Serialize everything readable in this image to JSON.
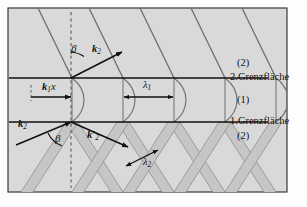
{
  "figure": {
    "type": "physics-wave-diagram",
    "panel": {
      "background_color": "#d9d9d9",
      "border_color": "#3a3a3a",
      "beam_fill_color": "#c2c2c2",
      "beam_stroke_color": "#8c8c8c",
      "line_color": "#2b2b2b"
    }
  },
  "interfaces": [
    {
      "id": "upper",
      "label": "2.Grenzfläche",
      "y": 78
    },
    {
      "id": "lower",
      "label": "1.Grenzfläche",
      "y": 122
    }
  ],
  "regions": [
    {
      "id": "above",
      "label": "(2)",
      "y": 64
    },
    {
      "id": "middle",
      "label": "(1)",
      "y": 100
    },
    {
      "id": "below",
      "label": "(2)",
      "y": 136
    }
  ],
  "vectors": [
    {
      "name": "k2-upper",
      "label_k": "k",
      "sub": "2",
      "prime": false,
      "x": 92,
      "y": 52
    },
    {
      "name": "k1x",
      "label_k": "k",
      "sub": "1",
      "suffix": "x",
      "prime": false,
      "x": 44,
      "y": 89
    },
    {
      "name": "k2-lower",
      "label_k": "k",
      "sub": "2",
      "prime": false,
      "x": 22,
      "y": 126
    },
    {
      "name": "k2-prime",
      "label_k": "k",
      "sub": "2",
      "prime": true,
      "x": 89,
      "y": 137
    }
  ],
  "angles": [
    {
      "name": "beta-upper",
      "label": "β",
      "x": 73,
      "y": 49
    },
    {
      "name": "beta-lower",
      "label": "β",
      "x": 57,
      "y": 139
    }
  ],
  "wavelengths": [
    {
      "name": "lambda-1",
      "label_sym": "λ",
      "sub": "1",
      "x": 148,
      "y": 86
    },
    {
      "name": "lambda-2",
      "label_sym": "λ",
      "sub": "2",
      "x": 148,
      "y": 163
    }
  ],
  "normal_line": {
    "name": "normal-dashed-line",
    "x": 71,
    "style": "dashed"
  }
}
